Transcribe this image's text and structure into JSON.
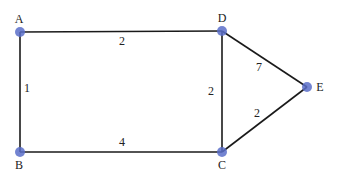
{
  "graph": {
    "nodes": [
      {
        "id": "A",
        "label": "A",
        "x": 20,
        "y": 32,
        "lx": 19,
        "ly": 23
      },
      {
        "id": "B",
        "label": "B",
        "x": 20,
        "y": 152,
        "lx": 19,
        "ly": 169
      },
      {
        "id": "C",
        "label": "C",
        "x": 222,
        "y": 152,
        "lx": 222,
        "ly": 169
      },
      {
        "id": "D",
        "label": "D",
        "x": 222,
        "y": 31,
        "lx": 222,
        "ly": 22
      },
      {
        "id": "E",
        "label": "E",
        "x": 307,
        "y": 87,
        "lx": 320,
        "ly": 91
      }
    ],
    "edges": [
      {
        "from": "A",
        "to": "D",
        "weight": "2",
        "lx": 122,
        "ly": 45
      },
      {
        "from": "A",
        "to": "B",
        "weight": "1",
        "lx": 27,
        "ly": 92
      },
      {
        "from": "B",
        "to": "C",
        "weight": "4",
        "lx": 122,
        "ly": 146
      },
      {
        "from": "D",
        "to": "C",
        "weight": "2",
        "lx": 211,
        "ly": 95
      },
      {
        "from": "D",
        "to": "E",
        "weight": "7",
        "lx": 259,
        "ly": 71
      },
      {
        "from": "C",
        "to": "E",
        "weight": "2",
        "lx": 257,
        "ly": 117
      }
    ],
    "colors": {
      "node": "#5b6fc9",
      "edge": "#1a1a1a",
      "label": "#222222"
    }
  }
}
